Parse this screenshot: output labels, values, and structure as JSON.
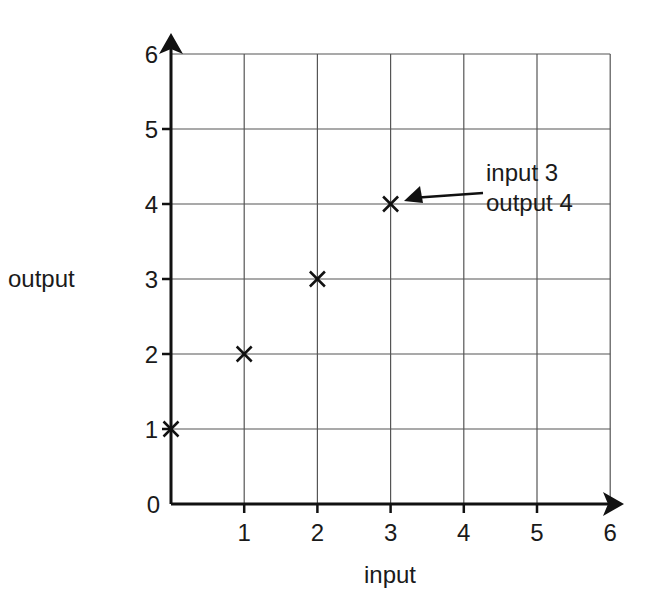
{
  "chart_data": {
    "type": "scatter",
    "title": "",
    "xlabel": "input",
    "ylabel": "output",
    "xlim": [
      0,
      6
    ],
    "ylim": [
      0,
      6
    ],
    "x_ticks": [
      "1",
      "2",
      "3",
      "4",
      "5",
      "6"
    ],
    "y_ticks": [
      "0",
      "1",
      "2",
      "3",
      "4",
      "5",
      "6"
    ],
    "grid": true,
    "marker": "x",
    "series": [
      {
        "name": "points",
        "x": [
          0,
          1,
          2,
          3
        ],
        "y": [
          1,
          2,
          3,
          4
        ]
      }
    ],
    "annotations": [
      {
        "text_line1": "input 3",
        "text_line2": "output 4",
        "x": 3,
        "y": 4
      }
    ]
  },
  "colors": {
    "axis": "#111111",
    "grid": "#555555",
    "marker": "#111111"
  }
}
